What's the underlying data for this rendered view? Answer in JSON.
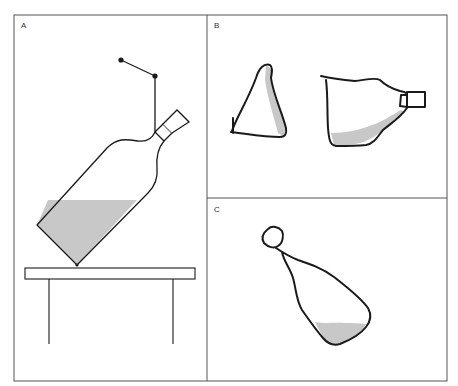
{
  "figure": {
    "panels": [
      {
        "id": "A",
        "label": "A",
        "description": "Tilted bottle resting on table edge, suspended by a pivoting arm, liquid surface level (horizontal)"
      },
      {
        "id": "B",
        "label": "B",
        "description": "Two hand-drawn shapes: a triangular shape with shading along one side, and a tilted bottle with liquid following the bottle's tilt"
      },
      {
        "id": "C",
        "label": "C",
        "description": "Hand-drawn tilted bottle with liquid pooled horizontally at the bottom"
      }
    ],
    "colors": {
      "stroke": "#1a1a1a",
      "liquid": "#c8c8c8",
      "frame": "#555555",
      "background": "#ffffff"
    }
  }
}
